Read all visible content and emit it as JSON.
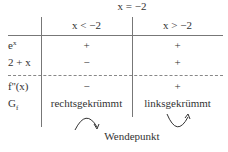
{
  "header": {
    "split_label": "x = −2"
  },
  "columns": [
    {
      "label": "x < −2"
    },
    {
      "label": "x > −2"
    }
  ],
  "rows": [
    {
      "label_base": "e",
      "label_sup": "x",
      "cells": [
        "+",
        "+"
      ]
    },
    {
      "label": "2 + x",
      "cells": [
        "−",
        "+"
      ]
    },
    {
      "label": "f''(x)",
      "cells": [
        "−",
        "+"
      ]
    },
    {
      "label_base": "G",
      "label_sub": "f",
      "cells": [
        "rechtsgekrümmt",
        "linksgekrümmt"
      ]
    }
  ],
  "footer": {
    "label": "Wendepunkt"
  },
  "icons": {
    "left": "arc-arrow-clockwise-down",
    "right": "arc-arrow-up-convex"
  }
}
